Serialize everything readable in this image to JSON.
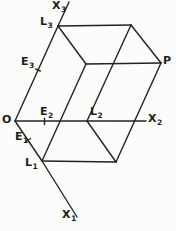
{
  "figure": {
    "background_color": "#fcfcfb",
    "line_color": "#222222",
    "label_color": "#1c1c1c",
    "width": 176,
    "height": 231
  },
  "diagram": {
    "points": {
      "O": {
        "x": 15,
        "y": 121
      },
      "L1": {
        "x": 42,
        "y": 161
      },
      "L2": {
        "x": 87,
        "y": 121
      },
      "L3": {
        "x": 58,
        "y": 26
      },
      "L13": {
        "x": 86,
        "y": 64
      },
      "L23": {
        "x": 131,
        "y": 25
      },
      "L12": {
        "x": 116,
        "y": 162
      },
      "P": {
        "x": 161,
        "y": 63
      },
      "X1end": {
        "x": 77,
        "y": 217
      },
      "X2end": {
        "x": 146,
        "y": 121
      },
      "X3end": {
        "x": 69,
        "y": 2
      }
    },
    "edges": [
      {
        "name": "x1-axis-inner",
        "from": "O",
        "to": "L1"
      },
      {
        "name": "x1-axis-outer",
        "from": "L1",
        "to": "X1end"
      },
      {
        "name": "x2-axis-inner",
        "from": "O",
        "to": "L2"
      },
      {
        "name": "x2-axis-outer",
        "from": "L2",
        "to": "X2end"
      },
      {
        "name": "x3-axis-inner",
        "from": "O",
        "to": "L3"
      },
      {
        "name": "x3-axis-outer",
        "from": "L3",
        "to": "X3end"
      },
      {
        "name": "edge-top-back",
        "from": "L3",
        "to": "L23"
      },
      {
        "name": "edge-top-right",
        "from": "L23",
        "to": "P"
      },
      {
        "name": "edge-top-front",
        "from": "L3",
        "to": "L13"
      },
      {
        "name": "edge-mid-horizontal",
        "from": "L13",
        "to": "P"
      },
      {
        "name": "edge-front-left",
        "from": "L13",
        "to": "L1"
      },
      {
        "name": "edge-back-inner",
        "from": "L23",
        "to": "L2"
      },
      {
        "name": "edge-right-front",
        "from": "P",
        "to": "L12"
      },
      {
        "name": "edge-bottom",
        "from": "L1",
        "to": "L12"
      },
      {
        "name": "edge-bottom-inner",
        "from": "L2",
        "to": "L12"
      }
    ],
    "ticks": [
      {
        "name": "tick-e1",
        "x1": 26,
        "y1": 141.5,
        "x2": 30.5,
        "y2": 138.5
      },
      {
        "name": "tick-e2",
        "x1": 44.5,
        "y1": 118.5,
        "x2": 44.5,
        "y2": 124.5
      },
      {
        "name": "tick-e3",
        "x1": 35.7,
        "y1": 69,
        "x2": 40.3,
        "y2": 71
      }
    ],
    "labels": [
      {
        "name": "label-x3",
        "base": "X",
        "sub": "3",
        "left": 52,
        "top": 0
      },
      {
        "name": "label-l3",
        "base": "L",
        "sub": "3",
        "left": 40,
        "top": 16
      },
      {
        "name": "label-e3",
        "base": "E",
        "sub": "3",
        "left": 21,
        "top": 56
      },
      {
        "name": "label-o",
        "base": "O",
        "sub": "",
        "left": 2,
        "top": 114
      },
      {
        "name": "label-e2",
        "base": "E",
        "sub": "2",
        "left": 40,
        "top": 106
      },
      {
        "name": "label-l2",
        "base": "L",
        "sub": "2",
        "left": 90,
        "top": 106
      },
      {
        "name": "label-x2",
        "base": "X",
        "sub": "2",
        "left": 148,
        "top": 113
      },
      {
        "name": "label-p",
        "base": "P",
        "sub": "",
        "left": 163,
        "top": 55
      },
      {
        "name": "label-e1",
        "base": "E",
        "sub": "1",
        "left": 15,
        "top": 131
      },
      {
        "name": "label-l1",
        "base": "L",
        "sub": "1",
        "left": 25,
        "top": 157
      },
      {
        "name": "label-x1",
        "base": "X",
        "sub": "1",
        "left": 62,
        "top": 209
      }
    ]
  }
}
